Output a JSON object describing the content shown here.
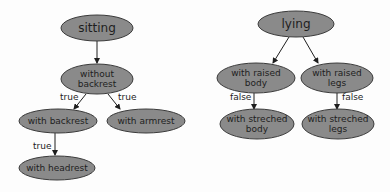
{
  "diagram": {
    "type": "tree",
    "colors": {
      "node_fill": "#8a8a8a",
      "node_stroke": "#3a3a3a",
      "text": "#1e1e1e",
      "background": "#fdfdfd"
    },
    "nodes": [
      {
        "id": "sitting",
        "lines": [
          "sitting"
        ],
        "cx": 97,
        "cy": 28,
        "rx": 36,
        "ry": 13,
        "size": 12
      },
      {
        "id": "without_backrest",
        "lines": [
          "without",
          "backrest"
        ],
        "cx": 97,
        "cy": 79,
        "rx": 36,
        "ry": 15,
        "size": 9
      },
      {
        "id": "with_backrest",
        "lines": [
          "with backrest"
        ],
        "cx": 58,
        "cy": 121,
        "rx": 39,
        "ry": 12,
        "size": 9
      },
      {
        "id": "with_armrest",
        "lines": [
          "with armrest"
        ],
        "cx": 146,
        "cy": 121,
        "rx": 39,
        "ry": 12,
        "size": 9
      },
      {
        "id": "with_headrest",
        "lines": [
          "with headrest"
        ],
        "cx": 57,
        "cy": 168,
        "rx": 38,
        "ry": 12,
        "size": 9
      },
      {
        "id": "lying",
        "lines": [
          "lying"
        ],
        "cx": 296,
        "cy": 24,
        "rx": 38,
        "ry": 13,
        "size": 12
      },
      {
        "id": "with_raised_body",
        "lines": [
          "with raised",
          "body"
        ],
        "cx": 256,
        "cy": 78,
        "rx": 39,
        "ry": 15,
        "size": 9
      },
      {
        "id": "with_raised_legs",
        "lines": [
          "with raised",
          "legs"
        ],
        "cx": 337,
        "cy": 78,
        "rx": 36,
        "ry": 15,
        "size": 9
      },
      {
        "id": "with_streched_body",
        "lines": [
          "with streched",
          "body"
        ],
        "cx": 257,
        "cy": 124,
        "rx": 37,
        "ry": 15,
        "size": 9
      },
      {
        "id": "with_streched_legs",
        "lines": [
          "with streched",
          "legs"
        ],
        "cx": 338,
        "cy": 124,
        "rx": 36,
        "ry": 15,
        "size": 9
      }
    ],
    "edges": [
      {
        "from": "sitting",
        "to": "without_backrest",
        "label": "",
        "x1": 97,
        "y1": 41,
        "x2": 97,
        "y2": 63
      },
      {
        "from": "without_backrest",
        "to": "with_backrest",
        "label": "true",
        "x1": 86,
        "y1": 94,
        "x2": 74,
        "y2": 109,
        "lx": 60,
        "ly": 100
      },
      {
        "from": "without_backrest",
        "to": "with_armrest",
        "label": "true",
        "x1": 108,
        "y1": 94,
        "x2": 120,
        "y2": 109,
        "lx": 118,
        "ly": 100
      },
      {
        "from": "with_backrest",
        "to": "with_headrest",
        "label": "true",
        "x1": 55,
        "y1": 133,
        "x2": 55,
        "y2": 155,
        "lx": 33,
        "ly": 149
      },
      {
        "from": "lying",
        "to": "with_raised_body",
        "label": "",
        "x1": 289,
        "y1": 37,
        "x2": 273,
        "y2": 63
      },
      {
        "from": "lying",
        "to": "with_raised_legs",
        "label": "",
        "x1": 303,
        "y1": 37,
        "x2": 318,
        "y2": 63
      },
      {
        "from": "with_raised_body",
        "to": "with_streched_body",
        "label": "false",
        "x1": 254,
        "y1": 93,
        "x2": 254,
        "y2": 109,
        "lx": 230,
        "ly": 100
      },
      {
        "from": "with_raised_legs",
        "to": "with_streched_legs",
        "label": "false",
        "x1": 337,
        "y1": 93,
        "x2": 337,
        "y2": 109,
        "lx": 342,
        "ly": 100
      }
    ]
  }
}
